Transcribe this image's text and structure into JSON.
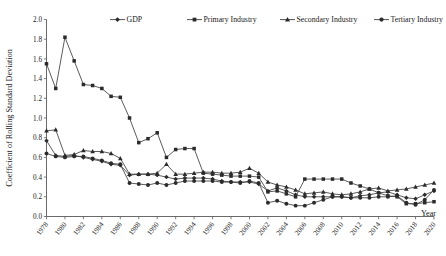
{
  "chart_data": {
    "type": "line",
    "title": "",
    "xlabel": "Year",
    "ylabel": "Coefficient of Rolling Standard Deviation",
    "ylim": [
      0.0,
      2.0
    ],
    "xlim": [
      1978,
      2020
    ],
    "grid": false,
    "legend_position": "top",
    "ytick_labels": [
      "0.0",
      "0.2",
      "0.4",
      "0.6",
      "0.8",
      "1.0",
      "1.2",
      "1.4",
      "1.6",
      "1.8",
      "2.0"
    ],
    "ytick_values": [
      0.0,
      0.2,
      0.4,
      0.6,
      0.8,
      1.0,
      1.2,
      1.4,
      1.6,
      1.8,
      2.0
    ],
    "xtick_labels": [
      "1978",
      "1980",
      "1982",
      "1984",
      "1986",
      "1988",
      "1990",
      "1992",
      "1994",
      "1996",
      "1998",
      "2000",
      "2002",
      "2004",
      "2006",
      "2008",
      "2010",
      "2012",
      "2014",
      "2016",
      "2018",
      "2020"
    ],
    "x": [
      1978,
      1979,
      1980,
      1981,
      1982,
      1983,
      1984,
      1985,
      1986,
      1987,
      1988,
      1989,
      1990,
      1991,
      1992,
      1993,
      1994,
      1995,
      1996,
      1997,
      1998,
      1999,
      2000,
      2001,
      2002,
      2003,
      2004,
      2005,
      2006,
      2007,
      2008,
      2009,
      2010,
      2011,
      2012,
      2013,
      2014,
      2015,
      2016,
      2017,
      2018,
      2019,
      2020
    ],
    "series": [
      {
        "name": "GDP",
        "marker": "diamond",
        "values": [
          0.77,
          0.62,
          0.61,
          0.62,
          0.6,
          0.58,
          0.56,
          0.53,
          0.52,
          0.42,
          0.43,
          0.43,
          0.42,
          0.4,
          0.38,
          0.39,
          0.39,
          0.39,
          0.38,
          0.36,
          0.35,
          0.35,
          0.35,
          0.33,
          0.26,
          0.29,
          0.26,
          0.22,
          0.2,
          0.2,
          0.2,
          0.2,
          0.2,
          0.19,
          0.21,
          0.22,
          0.24,
          0.25,
          0.22,
          0.19,
          0.18,
          0.22,
          0.26
        ]
      },
      {
        "name": "Primary Industry",
        "marker": "square",
        "values": [
          1.55,
          1.3,
          1.82,
          1.58,
          1.34,
          1.33,
          1.3,
          1.22,
          1.21,
          1.0,
          0.75,
          0.79,
          0.85,
          0.6,
          0.68,
          0.69,
          0.69,
          0.44,
          0.43,
          0.42,
          0.41,
          0.41,
          0.41,
          0.4,
          0.25,
          0.26,
          0.23,
          0.2,
          0.38,
          0.38,
          0.38,
          0.38,
          0.38,
          0.34,
          0.31,
          0.28,
          0.24,
          0.21,
          0.2,
          0.13,
          0.13,
          0.14,
          0.15
        ]
      },
      {
        "name": "Secondary Industry",
        "marker": "triangle",
        "values": [
          0.87,
          0.88,
          0.62,
          0.63,
          0.67,
          0.66,
          0.66,
          0.64,
          0.59,
          0.43,
          0.43,
          0.43,
          0.44,
          0.53,
          0.43,
          0.43,
          0.44,
          0.45,
          0.45,
          0.44,
          0.44,
          0.45,
          0.49,
          0.44,
          0.35,
          0.32,
          0.3,
          0.27,
          0.23,
          0.24,
          0.25,
          0.23,
          0.22,
          0.23,
          0.25,
          0.28,
          0.29,
          0.26,
          0.27,
          0.28,
          0.3,
          0.32,
          0.34
        ]
      },
      {
        "name": "Tertiary Industry",
        "marker": "circle",
        "values": [
          0.64,
          0.61,
          0.6,
          0.61,
          0.61,
          0.59,
          0.57,
          0.54,
          0.53,
          0.34,
          0.33,
          0.32,
          0.34,
          0.32,
          0.34,
          0.36,
          0.36,
          0.36,
          0.36,
          0.35,
          0.35,
          0.34,
          0.36,
          0.34,
          0.14,
          0.16,
          0.13,
          0.11,
          0.11,
          0.14,
          0.17,
          0.2,
          0.2,
          0.19,
          0.19,
          0.19,
          0.2,
          0.2,
          0.21,
          0.14,
          0.12,
          0.17,
          0.27
        ]
      }
    ]
  }
}
